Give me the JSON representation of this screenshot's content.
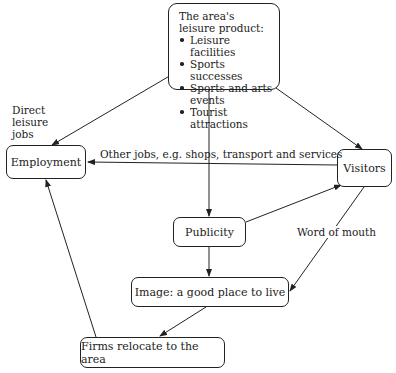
{
  "diagram": {
    "nodes": {
      "leisure_product": {
        "title_line1": "The area's",
        "title_line2": "leisure product:",
        "items": [
          "Leisure facilities",
          "Sports successes",
          "Sports and arts events",
          "Tourist attractions"
        ]
      },
      "employment": "Employment",
      "visitors": "Visitors",
      "publicity": "Publicity",
      "image": "Image: a good place to live",
      "firms": "Firms relocate to the area"
    },
    "edge_labels": {
      "direct_jobs_1": "Direct",
      "direct_jobs_2": "leisure",
      "direct_jobs_3": "jobs",
      "other_jobs": "Other jobs, e.g. shops, transport and services",
      "word_of_mouth": "Word of mouth"
    },
    "edges": [
      {
        "from": "leisure_product",
        "to": "employment",
        "label": "Direct leisure jobs"
      },
      {
        "from": "leisure_product",
        "to": "publicity"
      },
      {
        "from": "leisure_product",
        "to": "visitors"
      },
      {
        "from": "visitors",
        "to": "employment",
        "label": "Other jobs, e.g. shops, transport and services"
      },
      {
        "from": "publicity",
        "to": "visitors"
      },
      {
        "from": "publicity",
        "to": "image"
      },
      {
        "from": "visitors",
        "to": "image",
        "label": "Word of mouth"
      },
      {
        "from": "image",
        "to": "firms"
      },
      {
        "from": "firms",
        "to": "employment"
      }
    ]
  }
}
